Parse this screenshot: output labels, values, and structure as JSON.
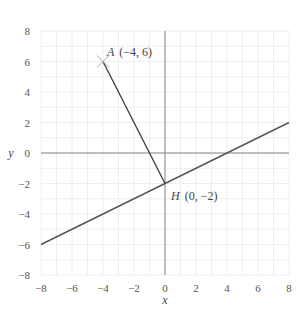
{
  "figure": {
    "top_cut_text": "",
    "x_axis": {
      "label": "x",
      "min": -8,
      "max": 8,
      "ticks": [
        "-8",
        "-6",
        "-4",
        "-2",
        "0",
        "2",
        "4",
        "6",
        "8"
      ],
      "tick_labels": [
        "−8",
        "−6",
        "−4",
        "−2",
        "0",
        "2",
        "4",
        "6",
        "8"
      ]
    },
    "y_axis": {
      "label": "y",
      "min": -8,
      "max": 8,
      "ticks": [
        "8",
        "6",
        "4",
        "2",
        "0",
        "-2",
        "-4",
        "-6",
        "-8"
      ],
      "tick_labels": [
        "8",
        "6",
        "4",
        "2",
        "0",
        "−2",
        "−4",
        "−6",
        "−8"
      ]
    },
    "grid": {
      "step": 1,
      "color": "#eeeeee"
    },
    "line": {
      "from": [
        -8,
        -6
      ],
      "to": [
        8,
        2
      ],
      "equation": "y = x/2 − 2",
      "color": "#555555"
    },
    "segment": {
      "from": [
        -4,
        6
      ],
      "to": [
        0,
        -2
      ],
      "color": "#444444"
    },
    "points": {
      "A": {
        "name": "A",
        "coords": "(−4, 6)",
        "x": -4,
        "y": 6,
        "marker": "cross"
      },
      "H": {
        "name": "H",
        "coords": "(0, −2)",
        "x": 0,
        "y": -2
      }
    },
    "colors": {
      "axis": "#888888",
      "grid": "#eeeeee",
      "marker": "#aaaaaa"
    }
  }
}
